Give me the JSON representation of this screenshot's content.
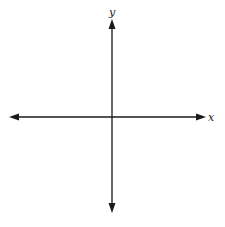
{
  "diagram": {
    "type": "coordinate-plane",
    "x_axis": {
      "label": "x",
      "arrows": "both"
    },
    "y_axis": {
      "label": "y",
      "arrows": "both"
    },
    "colors": {
      "axis": "#1a1a1a",
      "background": "#ffffff"
    }
  }
}
